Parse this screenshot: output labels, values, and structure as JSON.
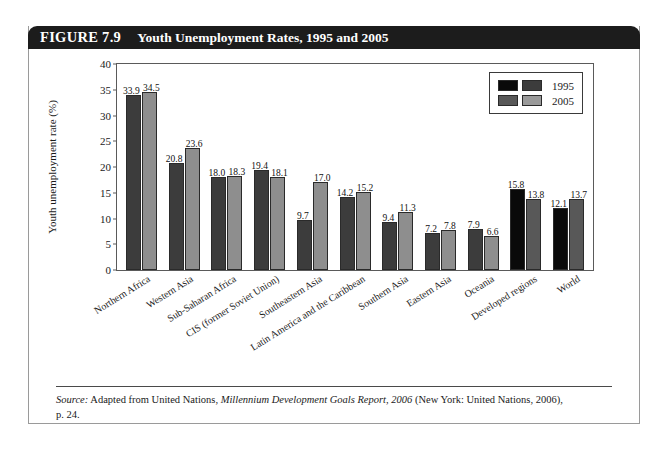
{
  "figure": {
    "label": "FIGURE 7.9",
    "title": "Youth Unemployment Rates, 1995 and 2005",
    "source_prefix": "Source:",
    "source_text_1": " Adapted from United Nations, ",
    "source_italic": "Millennium Development Goals Report, 2006",
    "source_text_2": " (New York: United Nations, 2006),",
    "source_text_3": "p. 24."
  },
  "legend": {
    "position": "top-right",
    "entries": [
      {
        "label": "1995",
        "colors": [
          "#0a0a0a",
          "#3c3c3c"
        ]
      },
      {
        "label": "2005",
        "colors": [
          "#585858",
          "#9a9a9a"
        ]
      }
    ]
  },
  "chart_data": {
    "type": "bar",
    "title": "Youth Unemployment Rates, 1995 and 2005",
    "xlabel": "",
    "ylabel": "Youth unemployment rate (%)",
    "ylim": [
      0,
      40
    ],
    "yticks": [
      0,
      5,
      10,
      15,
      20,
      25,
      30,
      35,
      40
    ],
    "grid": false,
    "categories": [
      "Northern Africa",
      "Western Asia",
      "Sub-Saharan Africa",
      "CIS (former Soviet Union)",
      "Southeastern Asia",
      "Latin America and the Caribbean",
      "Southern Asia",
      "Eastern Asia",
      "Oceania",
      "Developed regions",
      "World"
    ],
    "series": [
      {
        "name": "1995",
        "values": [
          33.9,
          20.8,
          18.0,
          19.4,
          9.7,
          14.2,
          9.4,
          7.2,
          7.9,
          15.8,
          12.1
        ],
        "colors": [
          "#3c3c3c",
          "#3c3c3c",
          "#3c3c3c",
          "#3c3c3c",
          "#3c3c3c",
          "#3c3c3c",
          "#3c3c3c",
          "#3c3c3c",
          "#3c3c3c",
          "#0a0a0a",
          "#0a0a0a"
        ]
      },
      {
        "name": "2005",
        "values": [
          34.5,
          23.6,
          18.3,
          18.1,
          17.0,
          15.2,
          11.3,
          7.8,
          6.6,
          13.8,
          13.7
        ],
        "colors": [
          "#8e8e8e",
          "#8e8e8e",
          "#8e8e8e",
          "#8e8e8e",
          "#8e8e8e",
          "#8e8e8e",
          "#8e8e8e",
          "#8e8e8e",
          "#8e8e8e",
          "#585858",
          "#585858"
        ]
      }
    ]
  }
}
